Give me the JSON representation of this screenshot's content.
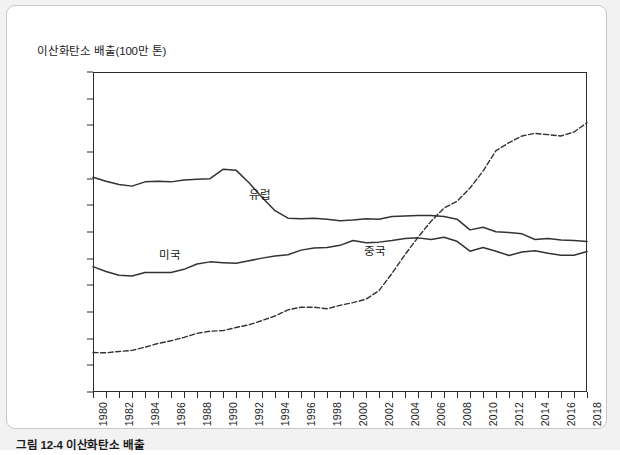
{
  "card": {
    "caption": "그림 12-4 이산화탄소 배출"
  },
  "chart_data": {
    "type": "line",
    "title": "이산화탄소 배출(100만 톤)",
    "xlabel": "",
    "ylabel": "이산화탄소 배출(100만 톤)",
    "ylim": [
      0,
      12000
    ],
    "xlim": [
      1980,
      2018
    ],
    "grid": false,
    "legend": "inline-annotations",
    "y_ticks": [
      0,
      1000,
      2000,
      3000,
      4000,
      5000,
      6000,
      7000,
      8000,
      9000,
      10000,
      11000,
      12000
    ],
    "x_ticks": [
      1980,
      1981,
      1982,
      1983,
      1984,
      1985,
      1986,
      1987,
      1988,
      1989,
      1990,
      1991,
      1992,
      1993,
      1994,
      1995,
      1996,
      1997,
      1998,
      1999,
      2000,
      2001,
      2002,
      2003,
      2004,
      2005,
      2006,
      2007,
      2008,
      2009,
      2010,
      2011,
      2012,
      2013,
      2014,
      2015,
      2016,
      2017,
      2018
    ],
    "x_tick_labels": [
      "1980",
      "",
      "1982",
      "",
      "1984",
      "",
      "1986",
      "",
      "1988",
      "",
      "1990",
      "",
      "1992",
      "",
      "1994",
      "",
      "1996",
      "",
      "1998",
      "",
      "2000",
      "",
      "2002",
      "",
      "2004",
      "",
      "2006",
      "",
      "2008",
      "",
      "2010",
      "",
      "2012",
      "",
      "2014",
      "",
      "2016",
      "",
      "2018"
    ],
    "x": [
      1980,
      1981,
      1982,
      1983,
      1984,
      1985,
      1986,
      1987,
      1988,
      1989,
      1990,
      1991,
      1992,
      1993,
      1994,
      1995,
      1996,
      1997,
      1998,
      1999,
      2000,
      2001,
      2002,
      2003,
      2004,
      2005,
      2006,
      2007,
      2008,
      2009,
      2010,
      2011,
      2012,
      2013,
      2014,
      2015,
      2016,
      2017,
      2018
    ],
    "series": [
      {
        "name": "유럽",
        "style": "solid",
        "color": "#333333",
        "values": [
          8050,
          7900,
          7780,
          7720,
          7880,
          7900,
          7880,
          7950,
          7980,
          8000,
          8350,
          8320,
          7850,
          7300,
          6800,
          6520,
          6500,
          6520,
          6480,
          6420,
          6450,
          6500,
          6480,
          6580,
          6600,
          6620,
          6620,
          6580,
          6480,
          6080,
          6180,
          6010,
          5980,
          5930,
          5720,
          5760,
          5700,
          5680,
          5640
        ]
      },
      {
        "name": "미국",
        "style": "solid",
        "color": "#333333",
        "values": [
          4700,
          4520,
          4380,
          4350,
          4480,
          4480,
          4480,
          4600,
          4800,
          4880,
          4850,
          4830,
          4920,
          5020,
          5100,
          5150,
          5320,
          5400,
          5420,
          5500,
          5680,
          5600,
          5620,
          5680,
          5760,
          5780,
          5720,
          5800,
          5650,
          5280,
          5420,
          5280,
          5120,
          5250,
          5300,
          5200,
          5130,
          5130,
          5270
        ]
      },
      {
        "name": "중국",
        "style": "dashed",
        "color": "#333333",
        "values": [
          1480,
          1470,
          1520,
          1560,
          1680,
          1820,
          1920,
          2050,
          2200,
          2280,
          2300,
          2420,
          2520,
          2680,
          2850,
          3080,
          3180,
          3180,
          3120,
          3250,
          3350,
          3480,
          3800,
          4450,
          5150,
          5800,
          6400,
          6900,
          7150,
          7650,
          8280,
          9050,
          9350,
          9600,
          9700,
          9650,
          9600,
          9750,
          10100
        ]
      }
    ],
    "annotations": [
      {
        "label": "유럽",
        "x": 1993,
        "y": 7200
      },
      {
        "label": "미국",
        "x": 1986,
        "y": 5050
      },
      {
        "label": "중국",
        "x": 2002,
        "y": 5250
      }
    ]
  }
}
